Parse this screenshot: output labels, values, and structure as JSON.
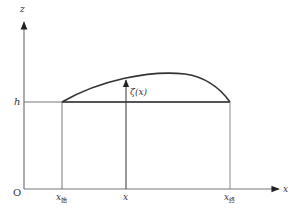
{
  "diagram": {
    "axes": {
      "z_label": "z",
      "x_label": "x",
      "origin_label": "O"
    },
    "level": {
      "label": "h"
    },
    "curve": {
      "label": "ζ(x)"
    },
    "x_ticks": {
      "start_main": "x",
      "start_sub": "始",
      "mid": "x",
      "end_main": "x",
      "end_sub": "终"
    },
    "colors": {
      "axis": "#777777",
      "line": "#333333",
      "text": "#333333"
    }
  }
}
